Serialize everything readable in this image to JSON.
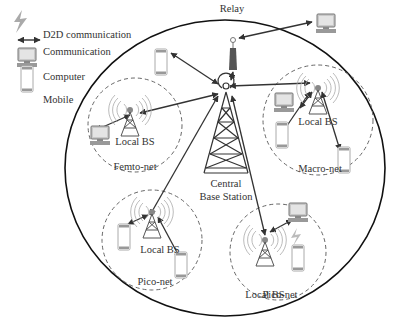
{
  "legend": {
    "items": [
      {
        "icon": "d2d-lightning-icon",
        "label": "D2D communication"
      },
      {
        "icon": "double-arrow-icon",
        "label": "Communication"
      },
      {
        "icon": "computer-icon",
        "label": "Computer"
      },
      {
        "icon": "mobile-icon",
        "label": "Mobile"
      }
    ]
  },
  "nodes": {
    "relay": "Relay",
    "central": {
      "line1": "Central",
      "line2": "Base Station"
    },
    "local_bs": "Local BS"
  },
  "cells": [
    {
      "name": "Femto-net"
    },
    {
      "name": "Macro-net"
    },
    {
      "name": "Pico-net"
    },
    {
      "name": "Pico-net"
    }
  ],
  "colors": {
    "line": "#333333",
    "dashed": "#666666",
    "device": "#b0b0b0",
    "text": "#333333"
  }
}
